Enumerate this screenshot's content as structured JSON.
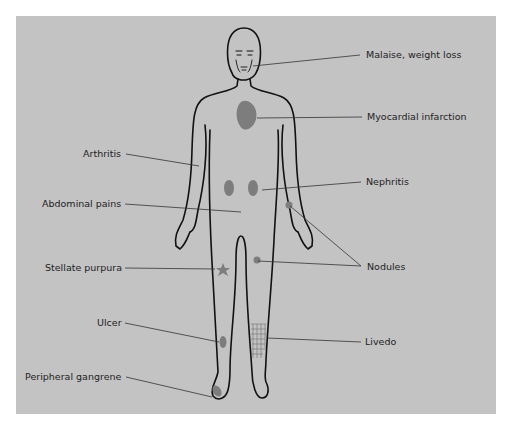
{
  "diagram": {
    "title": "",
    "background_color": "#c3c3c3",
    "lesion_color": "#7d7d7d",
    "outline_color": "#111111",
    "labels": [
      {
        "id": "malaise",
        "text": "Malaise, weight loss",
        "side": "right",
        "target": "face"
      },
      {
        "id": "mi",
        "text": "Myocardial infarction",
        "side": "right",
        "target": "heart"
      },
      {
        "id": "nephritis",
        "text": "Nephritis",
        "side": "right",
        "target": "kidney"
      },
      {
        "id": "nodules",
        "text": "Nodules",
        "side": "right",
        "target": "forearm and thigh nodules"
      },
      {
        "id": "livedo",
        "text": "Livedo",
        "side": "right",
        "target": "lower leg mesh pattern"
      },
      {
        "id": "arthritis",
        "text": "Arthritis",
        "side": "left",
        "target": "elbow"
      },
      {
        "id": "abdominal",
        "text": "Abdominal pains",
        "side": "left",
        "target": "abdomen"
      },
      {
        "id": "stellate",
        "text": "Stellate purpura",
        "side": "left",
        "target": "thigh star lesion"
      },
      {
        "id": "ulcer",
        "text": "Ulcer",
        "side": "left",
        "target": "lower leg oval lesion"
      },
      {
        "id": "gangrene",
        "text": "Peripheral gangrene",
        "side": "left",
        "target": "foot"
      }
    ]
  }
}
